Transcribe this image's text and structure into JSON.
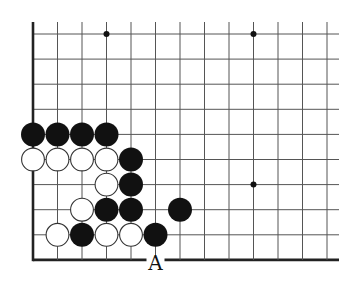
{
  "diagram": {
    "type": "go-board-fragment",
    "grid": {
      "columns": 13,
      "rows": 10,
      "origin_x": 33,
      "origin_y": 34,
      "spacing_x": 24.5,
      "spacing_y": 25.1,
      "line_top_extent": 22,
      "line_right_extent": 339,
      "left_edge_is_board_edge": true,
      "bottom_edge_is_board_edge": true,
      "line_color": "#555555",
      "edge_color": "#222222"
    },
    "star_points": [
      {
        "col": 3,
        "row": 0
      },
      {
        "col": 9,
        "row": 0
      },
      {
        "col": 9,
        "row": 6
      }
    ],
    "stones": [
      {
        "color": "black",
        "col": 0,
        "row": 4
      },
      {
        "color": "black",
        "col": 1,
        "row": 4
      },
      {
        "color": "black",
        "col": 2,
        "row": 4
      },
      {
        "color": "black",
        "col": 3,
        "row": 4
      },
      {
        "color": "white",
        "col": 0,
        "row": 5
      },
      {
        "color": "white",
        "col": 1,
        "row": 5
      },
      {
        "color": "white",
        "col": 2,
        "row": 5
      },
      {
        "color": "white",
        "col": 3,
        "row": 5
      },
      {
        "color": "black",
        "col": 4,
        "row": 5
      },
      {
        "color": "white",
        "col": 3,
        "row": 6
      },
      {
        "color": "black",
        "col": 4,
        "row": 6
      },
      {
        "color": "white",
        "col": 2,
        "row": 7
      },
      {
        "color": "black",
        "col": 3,
        "row": 7
      },
      {
        "color": "black",
        "col": 4,
        "row": 7
      },
      {
        "color": "black",
        "col": 6,
        "row": 7
      },
      {
        "color": "white",
        "col": 1,
        "row": 8
      },
      {
        "color": "black",
        "col": 2,
        "row": 8
      },
      {
        "color": "white",
        "col": 3,
        "row": 8
      },
      {
        "color": "white",
        "col": 4,
        "row": 8
      },
      {
        "color": "black",
        "col": 5,
        "row": 8
      }
    ],
    "labels": [
      {
        "text": "A",
        "col": 5,
        "row": 9
      }
    ],
    "colors": {
      "black_stone": "#111111",
      "white_stone_fill": "#ffffff",
      "white_stone_stroke": "#333333",
      "background": "#ffffff"
    }
  }
}
